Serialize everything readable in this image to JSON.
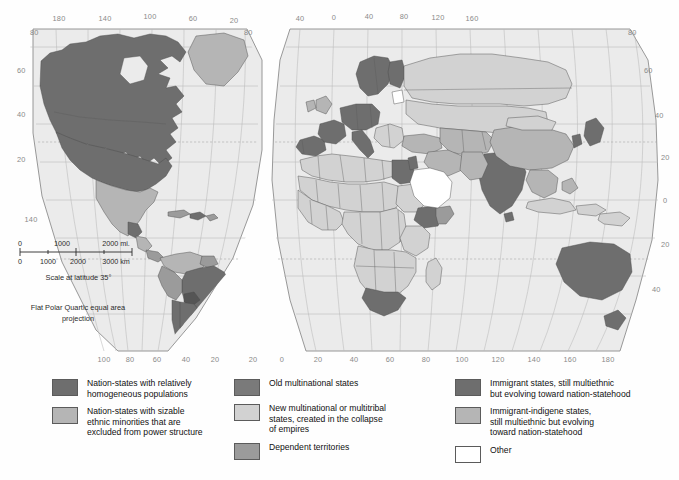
{
  "map": {
    "projection_note": "Flat Polar Quartic\nequal area projection",
    "scale": {
      "caption": "Scale at latitude 35°",
      "miles_ticks": [
        "0",
        "1000",
        "2000 mi."
      ],
      "km_ticks": [
        "0",
        "1000",
        "2000",
        "3000 km"
      ]
    },
    "west_panel": {
      "top_longitudes": [
        "180",
        "140",
        "100",
        "60",
        "20"
      ],
      "bottom_longitudes": [
        "100",
        "80",
        "60",
        "40",
        "20"
      ],
      "left_latitudes": [
        "80",
        "60",
        "40",
        "20"
      ],
      "right_latitudes": [
        "80"
      ],
      "corner_label": "140"
    },
    "east_panel": {
      "top_longitudes": [
        "40",
        "0",
        "40",
        "80",
        "120",
        "160"
      ],
      "bottom_longitudes": [
        "20",
        "0",
        "20",
        "40",
        "60",
        "80",
        "100",
        "120",
        "140",
        "160",
        "180"
      ],
      "left_latitudes": [],
      "right_latitudes": [
        "80",
        "60",
        "40",
        "20",
        "0",
        "20",
        "40"
      ]
    }
  },
  "colors": {
    "homogeneous": "#6e6e6e",
    "sizable_minorities": "#b5b5b5",
    "old_multinational": "#7a7a7a",
    "new_multinational": "#d2d2d2",
    "dependent_territories": "#9b9b9b",
    "immigrant_multiethnic": "#6e6e6e",
    "immigrant_indigene": "#b5b5b5",
    "other": "#ffffff",
    "ocean": "#ebebeb",
    "outline": "#4c4c4c"
  },
  "legend": {
    "columns": [
      {
        "items": [
          {
            "swatch": "homogeneous",
            "label": "Nation-states with relatively\nhomogeneous populations"
          },
          {
            "swatch": "sizable_minorities",
            "label": "Nation-states with sizable\nethnic minorities that are\nexcluded from power structure"
          }
        ]
      },
      {
        "items": [
          {
            "swatch": "old_multinational",
            "label": "Old multinational states"
          },
          {
            "swatch": "new_multinational",
            "label": "New multinational or multitribal\nstates, created in the collapse\nof empires"
          },
          {
            "swatch": "dependent_territories",
            "label": "Dependent territories"
          }
        ]
      },
      {
        "items": [
          {
            "swatch": "immigrant_multiethnic",
            "label": "Immigrant states, still multiethnic\nbut evolving toward nation-statehood"
          },
          {
            "swatch": "immigrant_indigene",
            "label": "Immigrant-indigene states,\nstill multiethnic but evolving\ntoward nation-statehood"
          },
          {
            "swatch": "other",
            "label": "Other"
          }
        ]
      }
    ]
  }
}
